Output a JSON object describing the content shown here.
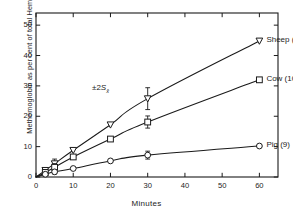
{
  "figure": {
    "background": "#ffffff",
    "ink": "#1a1a1a"
  },
  "axes": {
    "x_label": "Minutes",
    "y_label": "Methemoglobin as per cent of total Hemoglobin",
    "x_ticks": [
      "0",
      "10",
      "20",
      "30",
      "40",
      "50",
      "60"
    ],
    "y_ticks": [
      "0",
      "10",
      "20",
      "30",
      "40",
      "50"
    ]
  },
  "annotations": {
    "error_note_prefix": "±2",
    "error_note_symbol": "S",
    "error_note_subscript": "x̄"
  },
  "series_labels": {
    "sheep": "Sheep (10)",
    "cow": "Cow (10)",
    "pig": "Pig (9)"
  },
  "chart_data": {
    "type": "line",
    "title": "",
    "xlabel": "Minutes",
    "ylabel": "Methemoglobin as per cent of total Hemoglobin",
    "xlim": [
      0,
      65
    ],
    "ylim": [
      0,
      54
    ],
    "xticks": [
      0,
      10,
      20,
      30,
      40,
      50,
      60
    ],
    "yticks": [
      0,
      10,
      20,
      30,
      40,
      50
    ],
    "grid": false,
    "legend": "inline-right",
    "frame": "box",
    "tick_direction": "in",
    "series": [
      {
        "name": "Sheep (10)",
        "n": 10,
        "marker": "triangle-down-open",
        "x": [
          0,
          2.5,
          5,
          10,
          20,
          30,
          60
        ],
        "y": [
          0,
          2.2,
          4.4,
          8.8,
          17.2,
          25.8,
          44.8
        ],
        "errors": [
          {
            "x": 5,
            "y": 4.4,
            "err": 1.5
          },
          {
            "x": 30,
            "y": 25.8,
            "err": 3.6
          }
        ]
      },
      {
        "name": "Cow (10)",
        "n": 10,
        "marker": "square-open",
        "x": [
          0,
          2.5,
          5,
          10,
          20,
          30,
          60
        ],
        "y": [
          0,
          1.5,
          3.2,
          6.6,
          12.5,
          18.1,
          32.0
        ],
        "errors": [
          {
            "x": 5,
            "y": 3.2,
            "err": 1.2
          },
          {
            "x": 30,
            "y": 18.1,
            "err": 2.0
          }
        ]
      },
      {
        "name": "Pig (9)",
        "n": 9,
        "marker": "circle-open",
        "x": [
          0,
          2.5,
          5,
          10,
          20,
          30,
          60
        ],
        "y": [
          0,
          0.9,
          1.7,
          2.8,
          5.3,
          7.2,
          10.2
        ],
        "errors": [
          {
            "x": 5,
            "y": 1.7,
            "err": 0.7
          },
          {
            "x": 30,
            "y": 7.2,
            "err": 1.3
          }
        ]
      }
    ]
  }
}
